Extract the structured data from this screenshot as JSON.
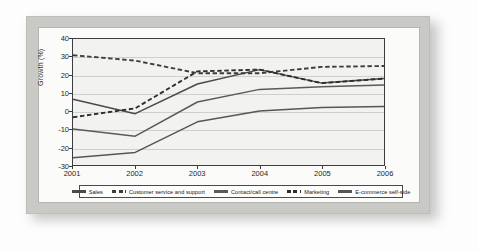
{
  "chart_data": {
    "type": "line",
    "title": "",
    "xlabel": "",
    "ylabel": "Growth (%)",
    "categories": [
      "2001",
      "2002",
      "2003",
      "2004",
      "2005",
      "2006"
    ],
    "x": [
      2001,
      2002,
      2003,
      2004,
      2005,
      2006
    ],
    "ylim": [
      -30,
      40
    ],
    "yticks": [
      40,
      30,
      20,
      10,
      0,
      -10,
      -20,
      -30
    ],
    "ytick_labels": [
      "40",
      "30",
      "20",
      "10",
      "0",
      "-10",
      "-20",
      "-30"
    ],
    "grid": true,
    "legend_position": "bottom",
    "series": [
      {
        "name": "Sales",
        "style": "solid",
        "color": "#4a4a4a",
        "values": [
          6.5,
          -1.5,
          15,
          23,
          15.5,
          18
        ]
      },
      {
        "name": "Customer service and support",
        "style": "dashed",
        "color": "#3d3d3d",
        "values": [
          31,
          28,
          21,
          21,
          24.5,
          25
        ]
      },
      {
        "name": "Contact/call centre",
        "style": "solid",
        "color": "#5a5a5a",
        "values": [
          -10,
          -14,
          5,
          12,
          13.5,
          14.5
        ]
      },
      {
        "name": "Marketing",
        "style": "dashed",
        "color": "#2e2e2e",
        "values": [
          -3.5,
          1.5,
          22,
          23,
          15.5,
          18
        ]
      },
      {
        "name": "E-commerce self-side",
        "style": "solid",
        "color": "#565656",
        "values": [
          -26,
          -23,
          -6,
          0,
          2,
          2.5
        ]
      }
    ]
  },
  "figure": {
    "y_axis_title": "Growth (%)"
  }
}
